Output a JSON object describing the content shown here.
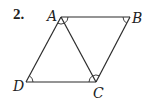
{
  "problem": {
    "number": "2."
  },
  "figure": {
    "type": "parallelogram with diagonal",
    "vertices": {
      "A": {
        "label": "A",
        "x": 61,
        "y": 17
      },
      "B": {
        "label": "B",
        "x": 130,
        "y": 17
      },
      "C": {
        "label": "C",
        "x": 96,
        "y": 82
      },
      "D": {
        "label": "D",
        "x": 26,
        "y": 82
      }
    },
    "segments": [
      "AB",
      "BC",
      "CD",
      "DA",
      "AC"
    ],
    "angle_marks": [
      "DAC",
      "BAC",
      "ABC",
      "ADC",
      "ACD",
      "ACB"
    ],
    "stroke_color": "#2b2b2b"
  }
}
